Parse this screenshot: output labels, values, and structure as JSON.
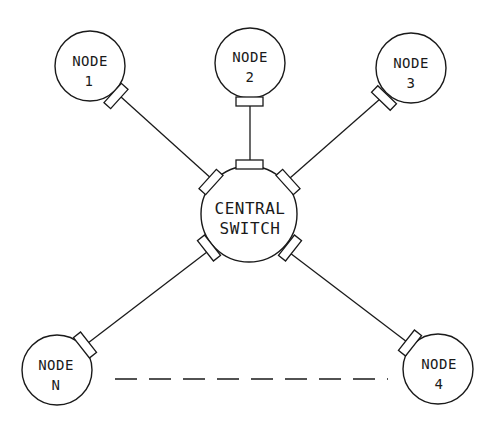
{
  "diagram": {
    "type": "star-topology",
    "hub": {
      "line1": "CENTRAL",
      "line2": "SWITCH"
    },
    "nodes": [
      {
        "id": "node-1",
        "line1": "NODE",
        "line2": "1"
      },
      {
        "id": "node-2",
        "line1": "NODE",
        "line2": "2"
      },
      {
        "id": "node-3",
        "line1": "NODE",
        "line2": "3"
      },
      {
        "id": "node-4",
        "line1": "NODE",
        "line2": "4"
      },
      {
        "id": "node-n",
        "line1": "NODE",
        "line2": "N"
      }
    ],
    "links": [
      {
        "from": "CENTRAL SWITCH",
        "to": "NODE 1"
      },
      {
        "from": "CENTRAL SWITCH",
        "to": "NODE 2"
      },
      {
        "from": "CENTRAL SWITCH",
        "to": "NODE 3"
      },
      {
        "from": "CENTRAL SWITCH",
        "to": "NODE 4"
      },
      {
        "from": "CENTRAL SWITCH",
        "to": "NODE N"
      }
    ],
    "ellipsis_link": {
      "from": "NODE N",
      "to": "NODE 4",
      "style": "dashed"
    },
    "colors": {
      "stroke": "#1a1a1a",
      "background": "#ffffff"
    }
  }
}
